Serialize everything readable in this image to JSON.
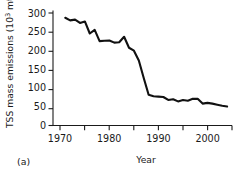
{
  "chart_data": {
    "type": "line",
    "title": "",
    "panel_label": "(a)",
    "xlabel": "Year",
    "ylabel_text": "TSS mass emissions (10",
    "ylabel_sup": "3",
    "ylabel_tail": " mt)",
    "ylabel_full": "TSS mass emissions (10³ mt)",
    "xlim": [
      1968.5,
      2005.0
    ],
    "ylim": [
      0,
      315
    ],
    "grid": false,
    "legend": "none",
    "y_ticks": [
      0,
      50,
      100,
      150,
      200,
      250,
      300
    ],
    "y_ticklabels": [
      "0",
      "50",
      "100",
      "150",
      "200",
      "250",
      "300"
    ],
    "x_ticks": [
      1970,
      1975,
      1980,
      1985,
      1990,
      1995,
      2000,
      2005
    ],
    "x_major_ticks": [
      1970,
      1980,
      1990,
      2000
    ],
    "x_ticklabels": [
      "1970",
      "",
      "1980",
      "",
      "1990",
      "",
      "2000",
      ""
    ],
    "x_major_ticklabels": [
      "1970",
      "1980",
      "1990",
      "2000"
    ],
    "series": [
      {
        "name": "TSS mass emissions",
        "color": "#111111",
        "x": [
          1971,
          1972,
          1973,
          1974,
          1975,
          1976,
          1977,
          1978,
          1979,
          1980,
          1981,
          1982,
          1983,
          1984,
          1985,
          1986,
          1987,
          1988,
          1989,
          1990,
          1991,
          1992,
          1993,
          1994,
          1995,
          1996,
          1997,
          1998,
          1999,
          2000,
          2001,
          2002,
          2003,
          2004
        ],
        "y": [
          295,
          288,
          290,
          281,
          285,
          252,
          262,
          231,
          232,
          233,
          227,
          228,
          243,
          213,
          205,
          178,
          130,
          84,
          80,
          79,
          78,
          70,
          72,
          66,
          70,
          68,
          73,
          73,
          60,
          62,
          60,
          57,
          54,
          52
        ]
      }
    ]
  }
}
